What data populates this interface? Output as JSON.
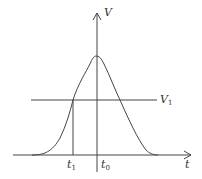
{
  "diagram": {
    "y_axis_label": "V",
    "x_axis_label": "t",
    "threshold_label": "V",
    "threshold_sub": "1",
    "t1_label": "t",
    "t1_sub": "1",
    "t0_label": "t",
    "t0_sub": "0",
    "colors": {
      "line": "#444444",
      "background": "#ffffff"
    }
  }
}
